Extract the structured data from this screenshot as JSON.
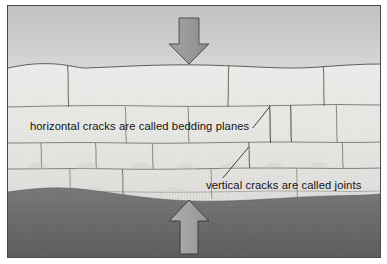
{
  "figure": {
    "kind": "geology-diagram",
    "background_color": "#ffffff",
    "border_color": "#4a4a4a"
  },
  "scene": {
    "sky": {
      "label": "sky",
      "color_top": "#c3c3c3",
      "color_bottom": "#dcdcda"
    },
    "rock": {
      "label": "rock layers",
      "color": "#e9e9e6",
      "line_color": "#6b6b68"
    },
    "ground": {
      "label": "soil",
      "color_top": "#767676",
      "color_bottom": "#5f5f5f"
    }
  },
  "arrows": {
    "top": {
      "name": "downward compression arrow",
      "direction": "down",
      "fill": "#959595",
      "stroke": "#4f4f4f"
    },
    "bottom": {
      "name": "upward compression arrow",
      "direction": "up",
      "fill": "#a3a3a3",
      "stroke": "#3c3c3c"
    }
  },
  "annotations": {
    "bedding_planes": {
      "text": "horizontal cracks are called bedding planes",
      "x": 30,
      "y": 124,
      "leader_color": "#2b2b2b"
    },
    "joints": {
      "text": "vertical cracks are called joints",
      "x": 207,
      "y": 183,
      "leader_color": "#2b2b2b"
    }
  }
}
